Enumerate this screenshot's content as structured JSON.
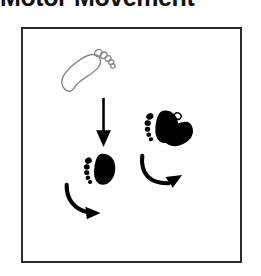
{
  "heading": {
    "text": "Motor Movement"
  },
  "panel": {
    "name": "motor-movement-illustration",
    "border_color": "#2b2b2b",
    "background_color": "#ffffff"
  },
  "colors": {
    "ink": "#000000",
    "outline_gray": "#8a8a8a",
    "frame": "#2b2b2b",
    "page": "#ffffff"
  },
  "figure": {
    "type": "diagram",
    "caption": "Motor Movement",
    "elements": [
      {
        "id": "footprint-outline-top",
        "kind": "footprint",
        "style": "outline",
        "fill": "none",
        "stroke": "#8a8a8a",
        "side": "right",
        "rotation_deg": -12,
        "x": 57,
        "y": 49,
        "width": 55,
        "height": 42,
        "toes": 5
      },
      {
        "id": "arrow-straight-down",
        "kind": "arrow",
        "style": "straight",
        "direction": "down",
        "color": "#000000",
        "x1": 103,
        "y1": 95,
        "x2": 103,
        "y2": 144
      },
      {
        "id": "footprint-solid-lower-left",
        "kind": "footprint",
        "style": "solid",
        "fill": "#000000",
        "stroke": "none",
        "side": "right",
        "rotation_deg": -8,
        "x": 82,
        "y": 150,
        "width": 35,
        "height": 36,
        "toes": 5
      },
      {
        "id": "arrow-curved-lower-left",
        "kind": "arrow",
        "style": "curved",
        "direction": "right",
        "sweep": "clockwise",
        "color": "#000000",
        "x": 63,
        "y": 184,
        "width": 48,
        "height": 33
      },
      {
        "id": "footprint-solid-upper-right",
        "kind": "footprint",
        "style": "solid",
        "fill": "#000000",
        "stroke": "none",
        "side": "right",
        "rotation_deg": -6,
        "x": 145,
        "y": 105,
        "width": 38,
        "height": 38,
        "toes": 5
      },
      {
        "id": "footprint-solid-rotated-overlap",
        "kind": "footprint",
        "style": "solid",
        "fill": "#000000",
        "stroke": "none",
        "side": "right",
        "rotation_deg": 52,
        "x": 163,
        "y": 112,
        "width": 36,
        "height": 36,
        "toes": 5,
        "note": "overlaps the upper-right footprint, rotated to show turning"
      },
      {
        "id": "arrow-curved-upper-right",
        "kind": "arrow",
        "style": "curved",
        "direction": "up-right",
        "sweep": "clockwise",
        "color": "#000000",
        "x": 140,
        "y": 155,
        "width": 54,
        "height": 35
      }
    ]
  }
}
